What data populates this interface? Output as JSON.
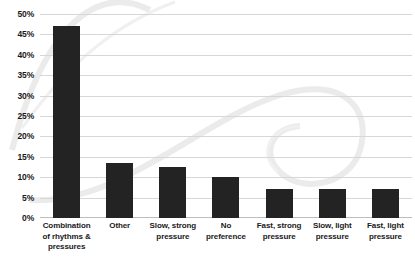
{
  "chart_data": {
    "type": "bar",
    "title": "",
    "xlabel": "",
    "ylabel": "",
    "ylim": [
      0,
      50
    ],
    "ytick_step": 5,
    "grid": true,
    "legend": "none",
    "orientation": "vertical",
    "bar_color": "#232323",
    "gridline_color": "#d7d7d7",
    "background_color": "#ffffff",
    "watermark_color": "#eceaea",
    "value_suffix": "%",
    "categories": [
      "Combination of rhythms & pressures",
      "Other",
      "Slow, strong pressure",
      "No preference",
      "Fast, strong pressure",
      "Slow, light pressure",
      "Fast, light pressure"
    ],
    "category_lines": [
      [
        "Combination",
        "of rhythms &",
        "pressures"
      ],
      [
        "Other"
      ],
      [
        "Slow, strong",
        "pressure"
      ],
      [
        "No",
        "preference"
      ],
      [
        "Fast, strong",
        "pressure"
      ],
      [
        "Slow, light",
        "pressure"
      ],
      [
        "Fast, light",
        "pressure"
      ]
    ],
    "values": [
      47,
      13.5,
      12.5,
      10,
      7,
      7,
      7
    ],
    "ytick_labels": [
      "50%",
      "45%",
      "40%",
      "35%",
      "30%",
      "25%",
      "20%",
      "15%",
      "10%",
      "5%",
      "0%"
    ],
    "ytick_values": [
      50,
      45,
      40,
      35,
      30,
      25,
      20,
      15,
      10,
      5,
      0
    ]
  }
}
